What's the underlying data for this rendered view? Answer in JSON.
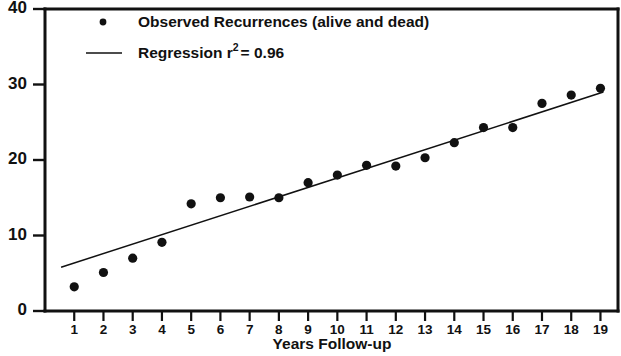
{
  "chart_data": {
    "type": "scatter",
    "title": "",
    "xlabel": "Years Follow-up",
    "ylabel": "",
    "xlim": [
      0,
      19.6
    ],
    "ylim": [
      0,
      40
    ],
    "grid": false,
    "legend_position": "top-left",
    "x": [
      1,
      2,
      3,
      4,
      5,
      6,
      7,
      8,
      9,
      10,
      11,
      12,
      13,
      14,
      15,
      16,
      17,
      18,
      19
    ],
    "xtick_labels": [
      "1",
      "2",
      "3",
      "4",
      "5",
      "6",
      "7",
      "8",
      "9",
      "10",
      "11",
      "12",
      "13",
      "14",
      "15",
      "16",
      "17",
      "18",
      "19"
    ],
    "ytick_labels": [
      "0",
      "10",
      "20",
      "30",
      "40"
    ],
    "ytick_values": [
      0,
      10,
      20,
      30,
      40
    ],
    "series": [
      {
        "name": "Observed Recurrences (alive and dead)",
        "marker": "dot",
        "values": [
          3.2,
          5.1,
          7.0,
          9.1,
          14.2,
          15.0,
          15.1,
          15.0,
          17.0,
          18.0,
          19.3,
          19.2,
          20.3,
          22.3,
          24.3,
          24.3,
          27.5,
          28.6,
          29.5
        ]
      }
    ],
    "regression": {
      "name": "Regression r² = 0.96",
      "r_squared": "0.96",
      "x_start": 0.55,
      "x_end": 19.1,
      "y_start": 5.8,
      "y_end": 29.0
    },
    "legend": [
      {
        "label": "Observed Recurrences (alive and dead)",
        "marker": "dot"
      },
      {
        "label_prefix": "Regression r",
        "label_sup": "2",
        "label_suffix": "= 0.96",
        "marker": "line"
      }
    ],
    "colors": {
      "ink": "#111111",
      "background": "#ffffff"
    }
  }
}
